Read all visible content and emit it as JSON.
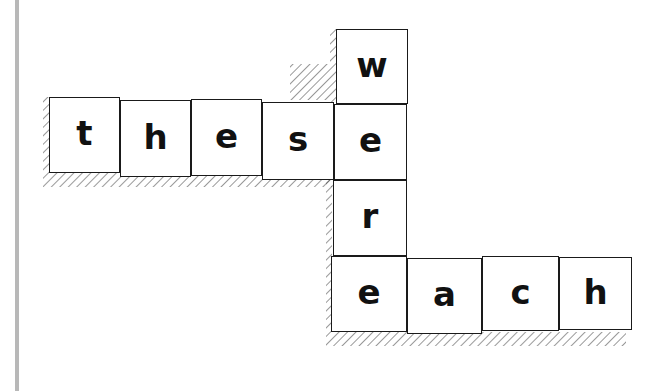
{
  "diagram": {
    "horizontal_word_top": "these",
    "vertical_word": "were",
    "horizontal_word_bottom": "each",
    "tiles": [
      {
        "letter": "t",
        "x": 49,
        "y": 97,
        "w": 71,
        "h": 76
      },
      {
        "letter": "h",
        "x": 120,
        "y": 100,
        "w": 71,
        "h": 77
      },
      {
        "letter": "e",
        "x": 191,
        "y": 99,
        "w": 71,
        "h": 77
      },
      {
        "letter": "s",
        "x": 262,
        "y": 102,
        "w": 72,
        "h": 78
      },
      {
        "letter": "w",
        "x": 336,
        "y": 29,
        "w": 72,
        "h": 75
      },
      {
        "letter": "e",
        "x": 334,
        "y": 104,
        "w": 73,
        "h": 76
      },
      {
        "letter": "r",
        "x": 333,
        "y": 180,
        "w": 74,
        "h": 76
      },
      {
        "letter": "e",
        "x": 331,
        "y": 256,
        "w": 76,
        "h": 76
      },
      {
        "letter": "a",
        "x": 407,
        "y": 258,
        "w": 75,
        "h": 76
      },
      {
        "letter": "c",
        "x": 482,
        "y": 256,
        "w": 77,
        "h": 75
      },
      {
        "letter": "h",
        "x": 559,
        "y": 257,
        "w": 73,
        "h": 73
      }
    ]
  }
}
